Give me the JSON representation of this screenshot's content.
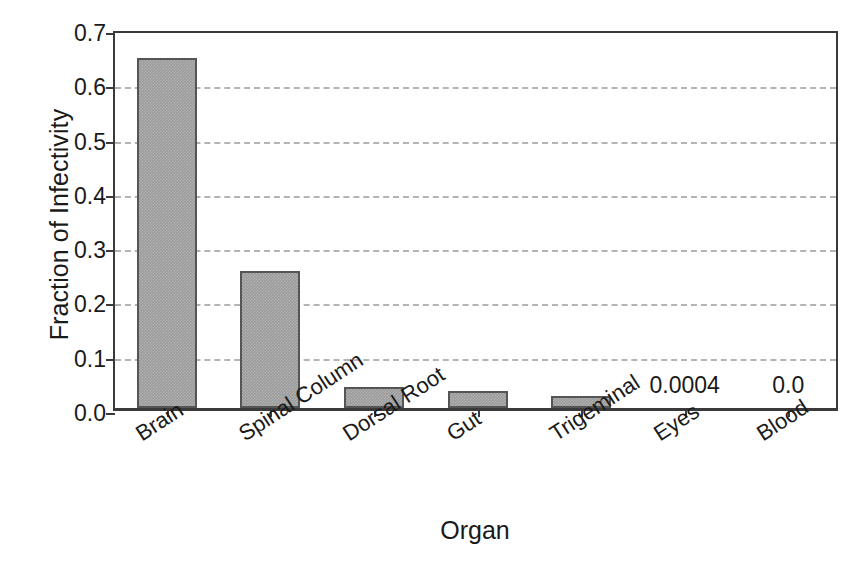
{
  "chart_data": {
    "type": "bar",
    "title": "",
    "subtitle": "",
    "xlabel": "Organ",
    "ylabel": "Fraction of Infectivity",
    "categories": [
      "Brain",
      "Spinal Column",
      "Dorsal Root",
      "Gut",
      "Trigeminal",
      "Eyes",
      "Blood"
    ],
    "values": [
      0.645,
      0.253,
      0.038,
      0.031,
      0.022,
      0.0004,
      0.0
    ],
    "ylim": [
      0.0,
      0.7
    ],
    "ytick_labels": [
      "0.0",
      "0.1",
      "0.2",
      "0.3",
      "0.4",
      "0.5",
      "0.6",
      "0.7"
    ],
    "ytick_values": [
      0.0,
      0.1,
      0.2,
      0.3,
      0.4,
      0.5,
      0.6,
      0.7
    ],
    "grid": "horizontal-dashed",
    "legend": "none",
    "annotations": [
      {
        "category": "Eyes",
        "text": "0.0004"
      },
      {
        "category": "Blood",
        "text": "0.0"
      }
    ],
    "colors": {
      "bar_fill": "#9a9a9a",
      "bar_edge": "#555555",
      "axis": "#3a3a3a",
      "grid": "#b4b4b4",
      "text": "#1a1a1a",
      "background": "#ffffff"
    }
  }
}
